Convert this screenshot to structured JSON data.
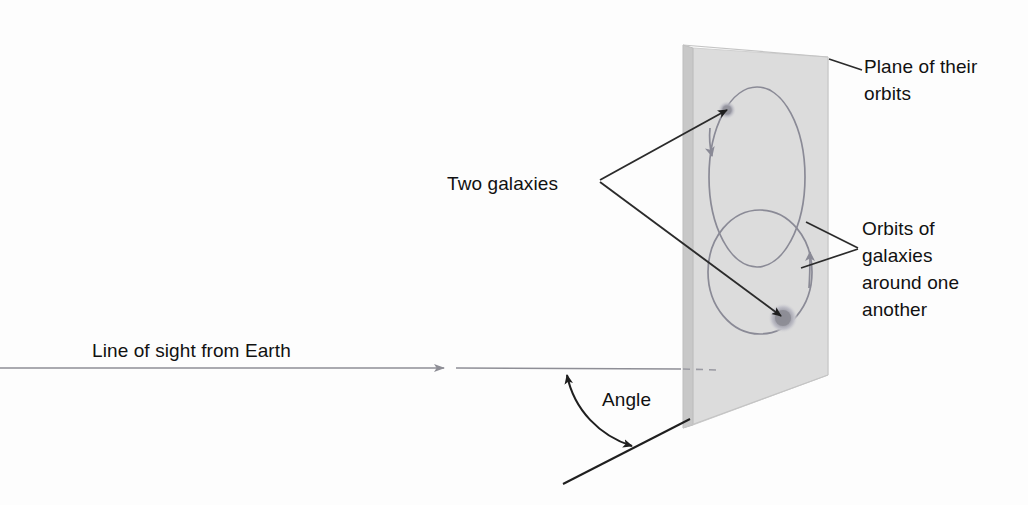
{
  "figure": {
    "background_color": "#fdfdfd"
  },
  "labels": {
    "plane_of_orbits": "Plane of their\norbits",
    "two_galaxies": "Two galaxies",
    "orbits_of_galaxies": "Orbits of\ngalaxies\naround one\nanother",
    "line_of_sight": "Line of sight from Earth",
    "angle": "Angle"
  },
  "colors": {
    "plane_face": "#dcdcdc",
    "plane_edge_strip": "#c6c6c6",
    "plane_outline": "#c0c0c0",
    "orbit_stroke": "#8a8a96",
    "leader_line": "#2b2b2b",
    "sight_line": "#8e8e96",
    "galaxy_core": "#8d8d96",
    "galaxy_halo": "#b9b9c2",
    "text": "#111111"
  },
  "geometry": {
    "plane": {
      "description": "Tilted rectangular plane of the galaxies' orbits",
      "top_left": [
        683,
        45
      ],
      "top_right": [
        828,
        57
      ],
      "bottom_right": [
        828,
        375
      ],
      "bottom_left": [
        683,
        428
      ],
      "edge_strip_width": 10
    },
    "orbits": [
      {
        "name": "upper-orbit",
        "cx": 757,
        "cy": 177,
        "rx": 48,
        "ry": 90,
        "arrow_direction": "clockwise",
        "arrowhead_at": [
          713,
          158
        ]
      },
      {
        "name": "lower-orbit",
        "cx": 760,
        "cy": 272,
        "rx": 52,
        "ry": 62,
        "arrow_direction": "counterclockwise",
        "arrowhead_at": [
          810,
          248
        ]
      }
    ],
    "galaxies": [
      {
        "name": "galaxy-upper",
        "cx": 727,
        "cy": 110,
        "r": 7
      },
      {
        "name": "galaxy-lower",
        "cx": 783,
        "cy": 318,
        "r": 13
      }
    ],
    "line_of_sight": {
      "start": [
        0,
        368
      ],
      "arrowhead": [
        448,
        368
      ],
      "solid_end": [
        681,
        369
      ],
      "dashed_end": [
        716,
        370
      ]
    },
    "angle_line": {
      "start": [
        563,
        484
      ],
      "end": [
        690,
        419
      ]
    },
    "angle_arc": {
      "vertex": [
        565,
        370
      ],
      "from": [
        565,
        372
      ],
      "to": [
        637,
        443
      ],
      "double_headed": true,
      "value_shown": false
    }
  }
}
